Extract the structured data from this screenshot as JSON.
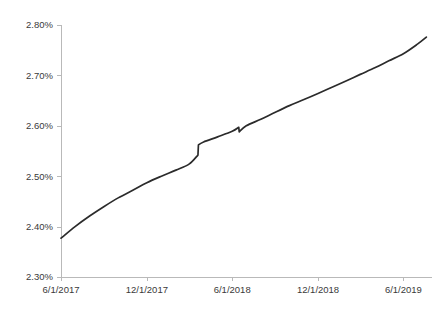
{
  "chart_data": {
    "type": "line",
    "title": "",
    "subtitle": "",
    "xlabel": "",
    "ylabel": "",
    "grid": false,
    "legend": false,
    "legend_position": "none",
    "line_color": "#2b2b2b",
    "axis_color": "#b9b9b9",
    "label_color": "#3a3a3a",
    "ylim": [
      2.3,
      2.8
    ],
    "y_ticks": [
      2.3,
      2.4,
      2.5,
      2.6,
      2.7,
      2.8
    ],
    "y_tick_labels": [
      "2.30%",
      "2.40%",
      "2.50%",
      "2.60%",
      "2.70%",
      "2.80%"
    ],
    "xlim": [
      "6/1/2017",
      "8/1/2019"
    ],
    "x_ticks": [
      "6/1/2017",
      "12/1/2017",
      "6/1/2018",
      "12/1/2018",
      "6/1/2019"
    ],
    "x_tick_labels": [
      "6/1/2017",
      "12/1/2017",
      "6/1/2018",
      "12/1/2018",
      "6/1/2019"
    ],
    "series": [
      {
        "name": "yield",
        "color": "#2b2b2b",
        "x": [
          "6/1/2017",
          "7/1/2017",
          "8/1/2017",
          "9/1/2017",
          "10/1/2017",
          "11/1/2017",
          "12/1/2017",
          "1/1/2018",
          "2/1/2018",
          "3/1/2018",
          "3/20/2018",
          "3/21/2018",
          "4/1/2018",
          "5/1/2018",
          "6/1/2018",
          "6/15/2018",
          "6/16/2018",
          "7/1/2018",
          "8/1/2018",
          "9/1/2018",
          "10/1/2018",
          "11/1/2018",
          "12/1/2018",
          "1/1/2019",
          "2/1/2019",
          "3/1/2019",
          "4/1/2019",
          "5/1/2019",
          "6/1/2019",
          "7/1/2019",
          "7/20/2019"
        ],
        "values": [
          2.377,
          2.4,
          2.421,
          2.44,
          2.457,
          2.472,
          2.487,
          2.5,
          2.512,
          2.524,
          2.542,
          2.562,
          2.568,
          2.578,
          2.589,
          2.597,
          2.588,
          2.6,
          2.613,
          2.627,
          2.64,
          2.652,
          2.664,
          2.677,
          2.69,
          2.702,
          2.715,
          2.729,
          2.743,
          2.762,
          2.776
        ]
      }
    ],
    "annotations": [
      {
        "name": "upward-step",
        "x": "3/20/2018",
        "from": 2.542,
        "to": 2.562
      },
      {
        "name": "downward-step",
        "x": "6/15/2018",
        "from": 2.597,
        "to": 2.588
      }
    ]
  },
  "geometry": {
    "plot_left": 61,
    "plot_right": 432,
    "plot_top": 25,
    "plot_bottom": 277
  }
}
